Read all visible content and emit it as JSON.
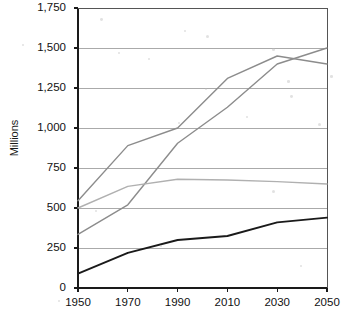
{
  "chart_data": {
    "type": "line",
    "title": "",
    "xlabel": "",
    "ylabel": "Millions",
    "x": [
      1950,
      1970,
      1990,
      2010,
      2030,
      2050
    ],
    "xtick_labels": [
      "1950",
      "1970",
      "1990",
      "2010",
      "2030",
      "2050"
    ],
    "ytick_labels": [
      "0",
      "250",
      "500",
      "750",
      "1,000",
      "1,250",
      "1,500",
      "1,750"
    ],
    "ytick_values": [
      0,
      250,
      500,
      750,
      1000,
      1250,
      1500,
      1750
    ],
    "xlim": [
      1950,
      2050
    ],
    "ylim": [
      0,
      1750
    ],
    "grid": "horizontal",
    "legend": "none",
    "series": [
      {
        "name": "series-1",
        "color": "#8c8c8c",
        "width": 1.4,
        "values": [
          545,
          890,
          1000,
          1310,
          1450,
          1400
        ]
      },
      {
        "name": "series-2",
        "color": "#8c8c8c",
        "width": 1.4,
        "values": [
          335,
          520,
          905,
          1130,
          1400,
          1500
        ]
      },
      {
        "name": "series-3",
        "color": "#b0b0b0",
        "width": 1.4,
        "values": [
          500,
          635,
          680,
          675,
          665,
          650
        ]
      },
      {
        "name": "series-4",
        "color": "#1a1a1a",
        "width": 1.9,
        "values": [
          90,
          220,
          300,
          325,
          410,
          440
        ]
      }
    ]
  }
}
